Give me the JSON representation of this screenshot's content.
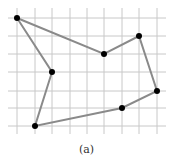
{
  "figure": {
    "caption": "(a)",
    "grid": {
      "x_lines": [
        17,
        35,
        52,
        70,
        87,
        104,
        122,
        139,
        157
      ],
      "y_lines": [
        18,
        36,
        54,
        72,
        91,
        108,
        126
      ],
      "x_min": 8,
      "x_max": 166,
      "y_min": 8,
      "y_max": 134,
      "color": "#c8c8c8"
    },
    "polygon": {
      "stroke": "#8a8a8a",
      "vertex_color": "#000000",
      "points": [
        {
          "x": 17,
          "y": 18
        },
        {
          "x": 104,
          "y": 54
        },
        {
          "x": 139,
          "y": 36
        },
        {
          "x": 157,
          "y": 91
        },
        {
          "x": 122,
          "y": 108
        },
        {
          "x": 35,
          "y": 126
        },
        {
          "x": 52,
          "y": 72
        }
      ]
    }
  }
}
